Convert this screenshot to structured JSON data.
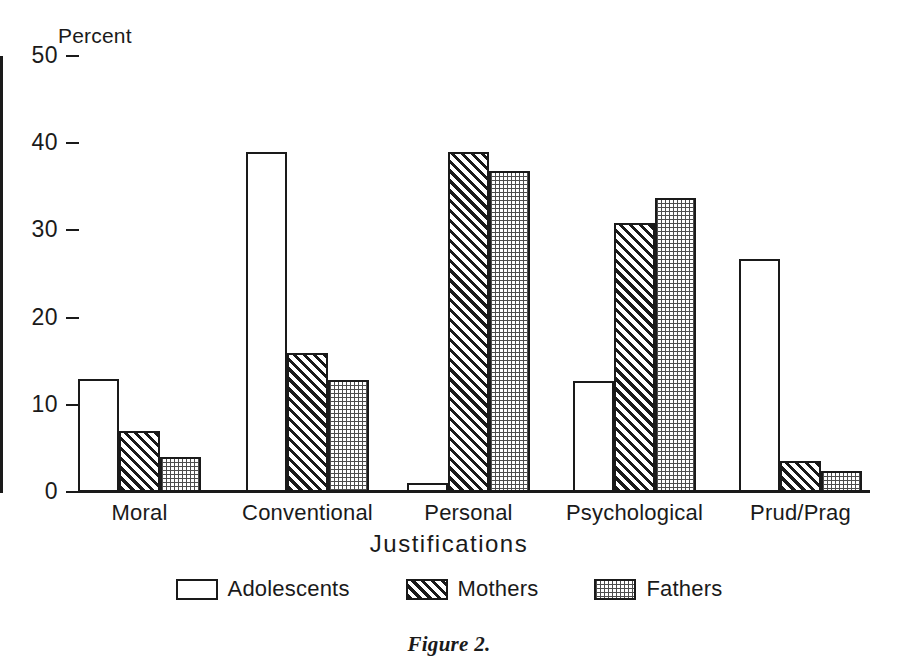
{
  "figure": {
    "caption": "Figure 2."
  },
  "axes": {
    "y_title": "Percent",
    "x_title": "Justifications",
    "y_ticks": [
      "0",
      "10",
      "20",
      "30",
      "40",
      "50"
    ]
  },
  "legend": {
    "items": [
      {
        "label": "Adolescents",
        "swatch": "white-open-box",
        "key": "adolescents"
      },
      {
        "label": "Mothers",
        "swatch": "diagonal-hatch-box",
        "key": "mothers"
      },
      {
        "label": "Fathers",
        "swatch": "stippled-dot-box",
        "key": "fathers"
      }
    ]
  },
  "chart_data": {
    "type": "bar",
    "title": "",
    "subtitle": "",
    "xlabel": "Justifications",
    "ylabel": "Percent",
    "ylim": [
      0,
      50
    ],
    "yticks": [
      0,
      10,
      20,
      30,
      40,
      50
    ],
    "grid": false,
    "legend_position": "bottom-center",
    "categories": [
      "Moral",
      "Conventional",
      "Personal",
      "Psychological",
      "Prud/Prag"
    ],
    "series": [
      {
        "name": "Adolescents",
        "fill": "white",
        "values": [
          13,
          39,
          1,
          12.7,
          26.7
        ]
      },
      {
        "name": "Mothers",
        "fill": "diagonal-hatch",
        "values": [
          7,
          15.9,
          39,
          30.8,
          3.5
        ]
      },
      {
        "name": "Fathers",
        "fill": "stipple",
        "values": [
          4,
          12.8,
          36.8,
          33.7,
          2.4
        ]
      }
    ]
  },
  "colors": {
    "ink": "#1a1a1a",
    "paper": "#ffffff",
    "stipple_gray": "#4d4d4d"
  }
}
